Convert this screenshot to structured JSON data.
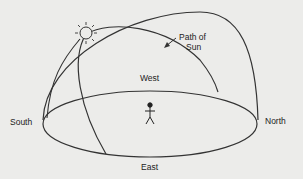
{
  "diagram": {
    "labels": {
      "south": "South",
      "north": "North",
      "east": "East",
      "west": "West",
      "path_line1": "Path of",
      "path_line2": "Sun"
    },
    "icons": [
      "sun-icon",
      "person-icon",
      "arrow-icon"
    ]
  }
}
